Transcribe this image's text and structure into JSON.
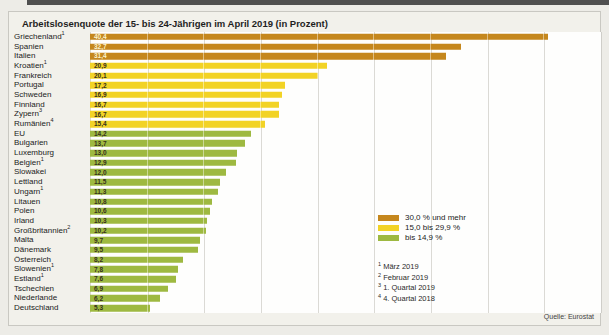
{
  "chart_data": {
    "type": "bar",
    "orientation": "horizontal",
    "title": "Arbeitslosenquote der 15- bis 24-Jährigen im April 2019 (in Prozent)",
    "xlim": [
      0,
      45
    ],
    "gridline_step": 5,
    "grid": true,
    "axis_tick_labels_visible": false,
    "value_format": "german-comma",
    "bars": [
      {
        "label": "Griechenland",
        "footnote": "1",
        "value": 40.4
      },
      {
        "label": "Spanien",
        "footnote": "",
        "value": 32.7
      },
      {
        "label": "Italien",
        "footnote": "",
        "value": 31.4
      },
      {
        "label": "Kroatien",
        "footnote": "1",
        "value": 20.9
      },
      {
        "label": "Frankreich",
        "footnote": "",
        "value": 20.1
      },
      {
        "label": "Portugal",
        "footnote": "",
        "value": 17.2
      },
      {
        "label": "Schweden",
        "footnote": "",
        "value": 16.9
      },
      {
        "label": "Finnland",
        "footnote": "",
        "value": 16.7
      },
      {
        "label": "Zypern",
        "footnote": "3",
        "value": 16.7
      },
      {
        "label": "Rumänien",
        "footnote": "4",
        "value": 15.4
      },
      {
        "label": "EU",
        "footnote": "",
        "value": 14.2
      },
      {
        "label": "Bulgarien",
        "footnote": "",
        "value": 13.7
      },
      {
        "label": "Luxemburg",
        "footnote": "",
        "value": 13.0
      },
      {
        "label": "Belgien",
        "footnote": "1",
        "value": 12.9
      },
      {
        "label": "Slowakei",
        "footnote": "",
        "value": 12.0
      },
      {
        "label": "Lettland",
        "footnote": "",
        "value": 11.5
      },
      {
        "label": "Ungarn",
        "footnote": "1",
        "value": 11.3
      },
      {
        "label": "Litauen",
        "footnote": "",
        "value": 10.8
      },
      {
        "label": "Polen",
        "footnote": "",
        "value": 10.6
      },
      {
        "label": "Irland",
        "footnote": "",
        "value": 10.3
      },
      {
        "label": "Großbritannien",
        "footnote": "2",
        "value": 10.2
      },
      {
        "label": "Malta",
        "footnote": "",
        "value": 9.7
      },
      {
        "label": "Dänemark",
        "footnote": "",
        "value": 9.5
      },
      {
        "label": "Österreich",
        "footnote": "",
        "value": 8.2
      },
      {
        "label": "Slowenien",
        "footnote": "1",
        "value": 7.8
      },
      {
        "label": "Estland",
        "footnote": "1",
        "value": 7.6
      },
      {
        "label": "Tschechien",
        "footnote": "",
        "value": 6.9
      },
      {
        "label": "Niederlande",
        "footnote": "",
        "value": 6.2
      },
      {
        "label": "Deutschland",
        "footnote": "",
        "value": 5.3
      }
    ],
    "thresholds": {
      "high_min": 30.0,
      "mid_min": 15.0
    },
    "colors": {
      "high": "#c5871d",
      "mid": "#f2d326",
      "low": "#9eb941",
      "value_text_on_high": "#fbf3cd",
      "value_text_on_mid_low": "#36301c"
    },
    "legend": [
      {
        "color_key": "high",
        "label": "30,0 % und mehr"
      },
      {
        "color_key": "mid",
        "label": "15,0 bis 29,9 %"
      },
      {
        "color_key": "low",
        "label": "bis 14,9 %"
      }
    ],
    "footnotes": [
      {
        "marker": "1",
        "text": "März 2019"
      },
      {
        "marker": "2",
        "text": "Februar 2019"
      },
      {
        "marker": "3",
        "text": "1. Quartal 2019"
      },
      {
        "marker": "4",
        "text": "4. Quartal 2018"
      }
    ],
    "source": "Quelle: Eurostat"
  }
}
